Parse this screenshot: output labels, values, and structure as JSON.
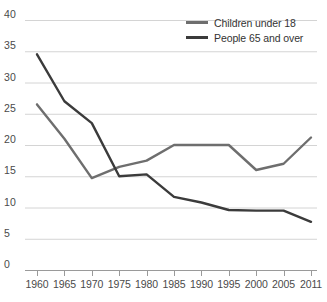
{
  "chart_data": {
    "type": "line",
    "title": "",
    "subtitle": "",
    "xlabel": "",
    "ylabel": "",
    "x": [
      1960,
      1965,
      1970,
      1975,
      1980,
      1985,
      1990,
      1995,
      2000,
      2005,
      2011
    ],
    "xticklabels": [
      "1960",
      "1965",
      "1970",
      "1975",
      "1980",
      "1985",
      "1990",
      "1995",
      "2000",
      "2005",
      "2011"
    ],
    "yticklabels": [
      "0",
      "5",
      "10",
      "15",
      "20",
      "25",
      "30",
      "35",
      "40"
    ],
    "yticks": [
      0,
      5,
      10,
      15,
      20,
      25,
      30,
      35,
      40
    ],
    "ylim": [
      0,
      40
    ],
    "xlim": [
      1960,
      2011
    ],
    "grid": "horizontal",
    "legend_position": "top-right",
    "series": [
      {
        "name": "Children under 18",
        "color": "#6e6e6e",
        "values": [
          26.5,
          21.0,
          14.7,
          16.5,
          17.5,
          20.0,
          20.0,
          20.0,
          16.0,
          17.0,
          21.2
        ]
      },
      {
        "name": "People 65 and over",
        "color": "#3b3b3b",
        "values": [
          34.5,
          27.0,
          23.5,
          15.0,
          15.3,
          11.7,
          10.8,
          9.6,
          9.5,
          9.5,
          7.7
        ]
      }
    ]
  },
  "legend": {
    "items": [
      {
        "label": "Children under 18",
        "color": "#6e6e6e"
      },
      {
        "label": "People 65 and over",
        "color": "#3b3b3b"
      }
    ]
  },
  "axis": {
    "grid_color": "#d4d4d4",
    "axis_color": "#9a9a9a",
    "tick_text_color": "#4a4a4a"
  }
}
